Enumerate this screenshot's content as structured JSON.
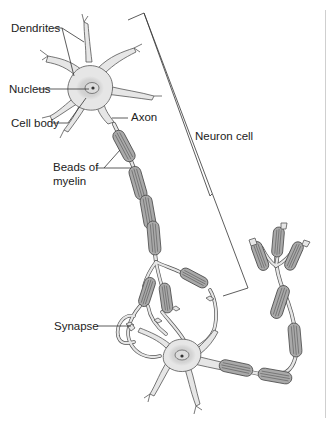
{
  "diagram": {
    "labels": {
      "dendrites": "Dendrites",
      "nucleus": "Nucleus",
      "cell_body": "Cell body",
      "axon": "Axon",
      "beads_line1": "Beads of",
      "beads_line2": "myelin",
      "neuron_cell": "Neuron cell",
      "synapse": "Synapse"
    },
    "colors": {
      "cell_fill": "#e6e6e6",
      "cell_stroke": "#555555",
      "nucleus_halo": "#cfcfcf",
      "myelin_fill": "#a9a9a9",
      "myelin_stroke": "#4a4a4a",
      "leader_line": "#333333",
      "background": "#ffffff"
    }
  }
}
